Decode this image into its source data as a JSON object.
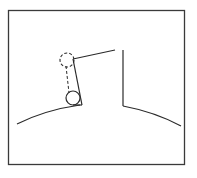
{
  "diagram": {
    "kind": "pendulum on a curved surface near a wall",
    "colors": {
      "background": "#ffffff",
      "stroke": "#2a2a2a",
      "frame": "#3a3a3a"
    },
    "frame": {
      "x": 8.5,
      "y": 10.5,
      "width": 176,
      "height": 154
    },
    "elements": {
      "left_ground_arc": "M17 124 Q45 110 80 105",
      "ceiling_string": "M73 59 L115 50",
      "wall_vertical": "M123 50 L123 106",
      "right_ground_arc": "M123 106 Q155 112 181 126",
      "rod_solid": "M73 59 L82 105",
      "rod_dashed": "M66 66 L69 93",
      "bob_initial": {
        "cx": 67,
        "cy": 60,
        "r": 7,
        "style": "dashed"
      },
      "bob_final": {
        "cx": 73,
        "cy": 98,
        "r": 7,
        "style": "solid"
      },
      "contact_tick": "M73 105 L82 105"
    }
  }
}
